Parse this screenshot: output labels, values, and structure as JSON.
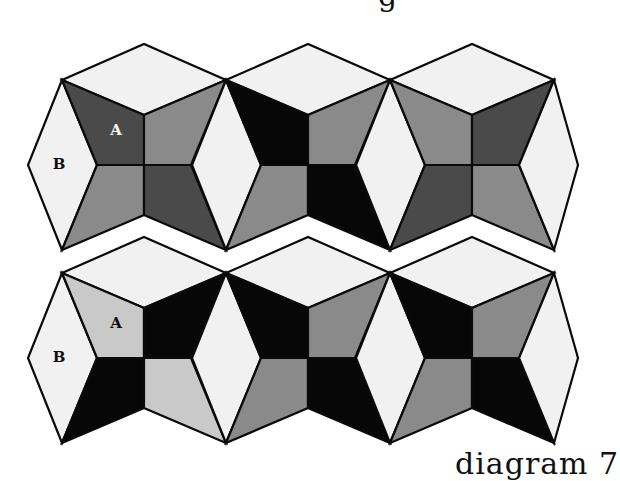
{
  "diagram": {
    "caption": "diagram 7",
    "top_fragment": "g",
    "colors": {
      "light": "#f1f1f1",
      "pale": "#c9c9c9",
      "mid": "#8a8a8a",
      "dark": "#4a4a4a",
      "black": "#070707",
      "stroke": "#0a0a0a"
    },
    "rows": [
      {
        "name": "top-row",
        "blocks": [
          {
            "quadrants": {
              "tl": "dark",
              "tr": "mid",
              "bl": "mid",
              "br": "dark"
            },
            "labels": {
              "A": "A",
              "B": "B"
            }
          },
          {
            "quadrants": {
              "tl": "black",
              "tr": "mid",
              "bl": "mid",
              "br": "black"
            }
          },
          {
            "quadrants": {
              "tl": "mid",
              "tr": "dark",
              "bl": "dark",
              "br": "mid"
            }
          }
        ]
      },
      {
        "name": "bottom-row",
        "blocks": [
          {
            "quadrants": {
              "tl": "pale",
              "tr": "black",
              "bl": "black",
              "br": "pale"
            },
            "labels": {
              "A": "A",
              "B": "B"
            }
          },
          {
            "quadrants": {
              "tl": "black",
              "tr": "mid",
              "bl": "mid",
              "br": "black"
            }
          },
          {
            "quadrants": {
              "tl": "black",
              "tr": "mid",
              "bl": "mid",
              "br": "black"
            }
          }
        ]
      }
    ]
  }
}
